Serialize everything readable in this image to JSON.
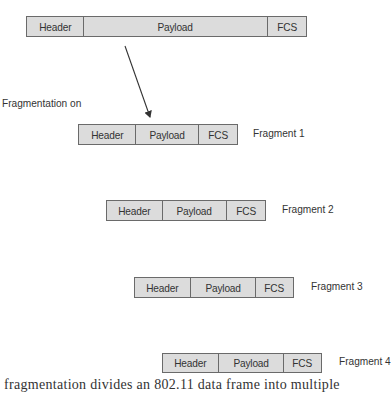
{
  "diagram": {
    "original_frame": {
      "fields": [
        {
          "name": "header",
          "label": "Header"
        },
        {
          "name": "payload",
          "label": "Payload"
        },
        {
          "name": "fcs",
          "label": "FCS"
        }
      ]
    },
    "annotation": "Fragmentation on",
    "fragments": [
      {
        "label": "Fragment 1",
        "fields": [
          "Header",
          "Payload",
          "FCS"
        ]
      },
      {
        "label": "Fragment 2",
        "fields": [
          "Header",
          "Payload",
          "FCS"
        ]
      },
      {
        "label": "Fragment 3",
        "fields": [
          "Header",
          "Payload",
          "FCS"
        ]
      },
      {
        "label": "Fragment 4",
        "fields": [
          "Header",
          "Payload",
          "FCS"
        ]
      }
    ],
    "caption_cropped": "fragmentation divides an 802.11 data frame into multiple"
  },
  "colors": {
    "box_fill": "#dcdcdc",
    "box_border": "#6a6a6a",
    "text": "#333333",
    "arrow": "#333333"
  }
}
